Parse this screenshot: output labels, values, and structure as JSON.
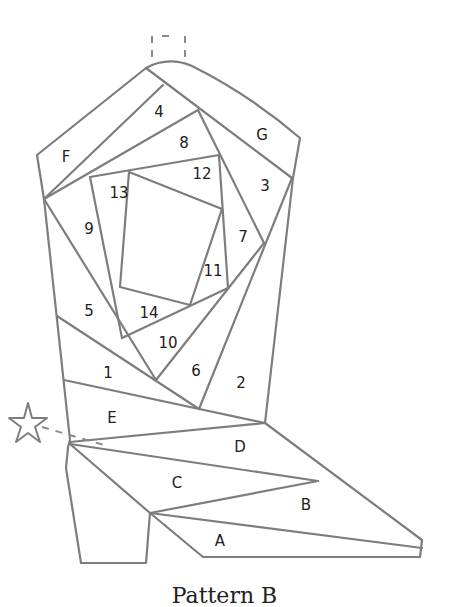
{
  "caption": "Pattern B",
  "colors": {
    "line": "#7d7d7d",
    "text": "#222222",
    "background": "#ffffff"
  },
  "pieces": {
    "numbered": [
      "1",
      "2",
      "3",
      "4",
      "5",
      "6",
      "7",
      "8",
      "9",
      "10",
      "11",
      "12",
      "13",
      "14"
    ],
    "lettered": [
      "A",
      "B",
      "C",
      "D",
      "E",
      "F",
      "G"
    ]
  },
  "labels": {
    "p1": "1",
    "p2": "2",
    "p3": "3",
    "p4": "4",
    "p5": "5",
    "p6": "6",
    "p7": "7",
    "p8": "8",
    "p9": "9",
    "p10": "10",
    "p11": "11",
    "p12": "12",
    "p13": "13",
    "p14": "14",
    "A": "A",
    "B": "B",
    "C": "C",
    "D": "D",
    "E": "E",
    "F": "F",
    "G": "G"
  },
  "icons": {
    "spur": "star-icon",
    "loop": "boot-strap-tab"
  }
}
